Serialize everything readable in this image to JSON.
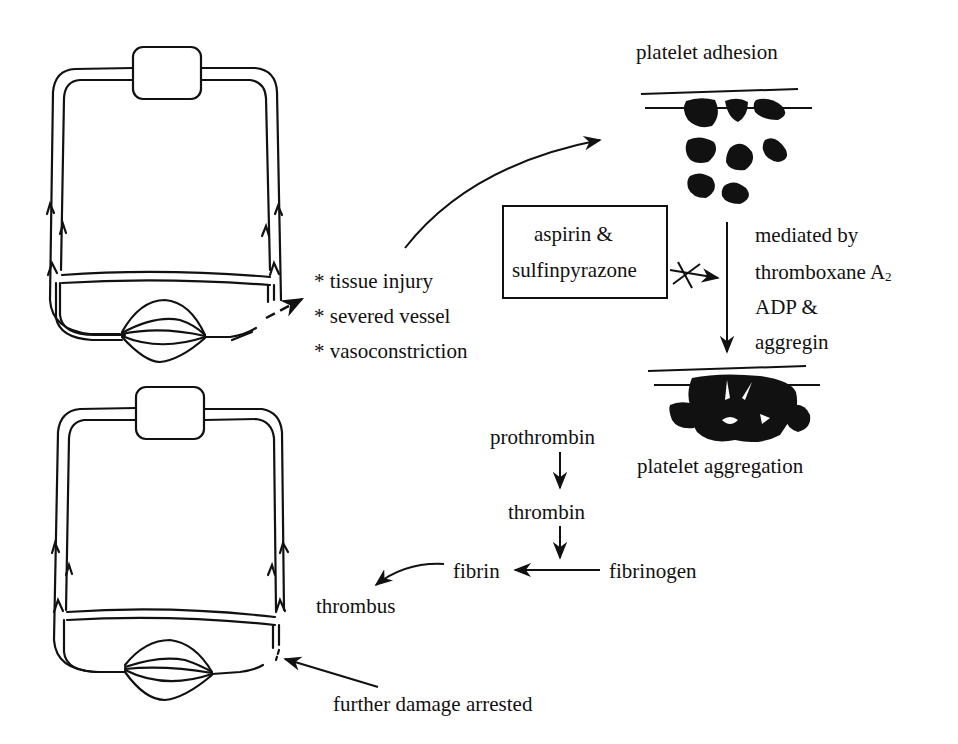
{
  "diagram": {
    "causes": {
      "bullet": "*",
      "items": [
        "tissue injury",
        "severed vessel",
        "vasoconstriction"
      ]
    },
    "platelet_adhesion_label": "platelet adhesion",
    "platelet_aggregation_label": "platelet aggregation",
    "inhibitor_box": {
      "line1": "aspirin &",
      "line2": "sulfinpyrazone",
      "effect": "blocked"
    },
    "mediators": {
      "line1": "mediated by",
      "line2": "thromboxane A",
      "line2_subscript": "2",
      "line3": "ADP &",
      "line4": "aggregin"
    },
    "coagulation_cascade": {
      "step1": "prothrombin",
      "step2": "thrombin",
      "fibrinogen": "fibrinogen",
      "fibrin": "fibrin",
      "result": "thrombus"
    },
    "outcome_label": "further damage arrested",
    "colors": {
      "ink": "#111111",
      "background": "#ffffff"
    }
  }
}
